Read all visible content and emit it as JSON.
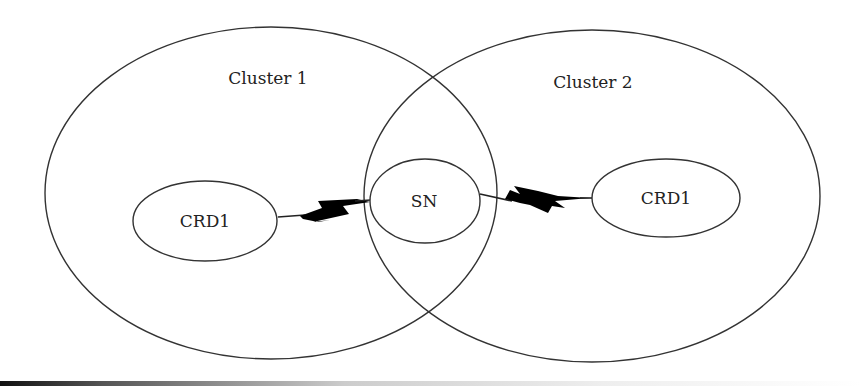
{
  "diagram": {
    "clusters": [
      {
        "label": "Cluster 1"
      },
      {
        "label": "Cluster 2"
      }
    ],
    "nodes": {
      "left_crd": {
        "label": "CRD1"
      },
      "sn": {
        "label": "SN"
      },
      "right_crd": {
        "label": "CRD1"
      }
    },
    "links": [
      {
        "from": "CRD1 (Cluster 1)",
        "to": "SN",
        "type": "wireless-link"
      },
      {
        "from": "SN",
        "to": "CRD1 (Cluster 2)",
        "type": "wireless-link"
      }
    ],
    "colors": {
      "stroke": "#333333",
      "lightning": "#000000",
      "background": "#ffffff"
    }
  }
}
